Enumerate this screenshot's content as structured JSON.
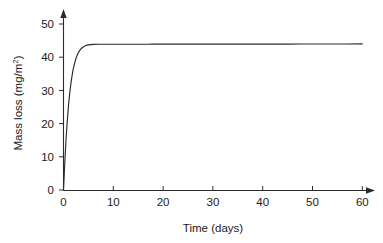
{
  "chart_data": {
    "type": "line",
    "title": "",
    "subtitle": "",
    "xlabel": "Time (days)",
    "ylabel": "Mass loss (mg/m²)",
    "ylabel_base": "Mass loss (mg/m",
    "ylabel_exponent": "2",
    "ylabel_close": ")",
    "xlim": [
      0,
      60
    ],
    "ylim": [
      0,
      52
    ],
    "xticks": [
      0,
      10,
      20,
      30,
      40,
      50,
      60
    ],
    "yticks": [
      0,
      10,
      20,
      30,
      40,
      50
    ],
    "xtick_labels": [
      "0",
      "10",
      "20",
      "30",
      "40",
      "50",
      "60"
    ],
    "ytick_labels": [
      "0",
      "10",
      "20",
      "30",
      "40",
      "50"
    ],
    "grid": false,
    "legend": false,
    "legend_position": "none",
    "annotations": [],
    "plateau_value": 44,
    "series": [
      {
        "name": "Mass loss",
        "color": "#2a2a2a",
        "x": [
          0,
          0.25,
          0.5,
          0.75,
          1,
          1.25,
          1.5,
          1.75,
          2,
          2.5,
          3,
          3.5,
          4,
          4.5,
          5,
          5.5,
          6,
          7,
          8,
          9,
          10,
          12,
          14,
          16,
          18,
          20,
          25,
          30,
          35,
          40,
          45,
          50,
          55,
          60
        ],
        "y": [
          0,
          8.0,
          15.0,
          20.6,
          25.3,
          29.1,
          32.2,
          34.7,
          36.7,
          39.6,
          41.4,
          42.5,
          43.1,
          43.5,
          43.7,
          43.8,
          43.85,
          43.9,
          43.9,
          43.9,
          43.9,
          43.9,
          43.9,
          43.9,
          43.92,
          43.92,
          43.93,
          43.94,
          43.95,
          43.95,
          43.96,
          43.97,
          43.98,
          44.0
        ]
      }
    ]
  },
  "axes": {
    "x_axis_name": "time-axis",
    "y_axis_name": "mass-loss-axis",
    "x_arrow": true,
    "y_arrow": true
  },
  "colors": {
    "curve": "#2a2a2a",
    "axis": "#2a2a2a",
    "text": "#1a1a1a",
    "background": "#ffffff"
  }
}
